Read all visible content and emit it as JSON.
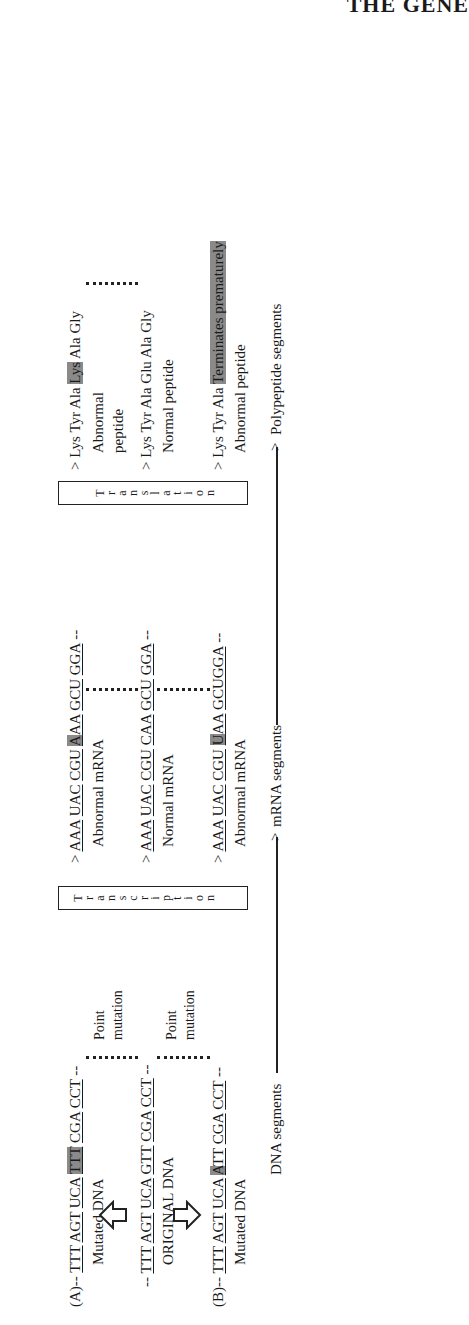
{
  "header": {
    "title": "THE GENE"
  },
  "rows": {
    "a": {
      "label": "(A)",
      "dna": [
        "TTT",
        "AGT",
        "UCA",
        "TTT",
        "CGA",
        "CCT"
      ],
      "dna_highlight_index": 3,
      "dna_caption": "Mutated DNA",
      "mrna": [
        "AAA",
        "UAC",
        "CGU",
        "AAA",
        "GCU",
        "GGA"
      ],
      "mrna_highlight_index": 3,
      "mrna_caption": "Abnormal mRNA",
      "peptide": [
        "Lys",
        "Tyr",
        "Ala",
        "Lys",
        "Ala",
        "Gly"
      ],
      "peptide_highlight_index": 3,
      "peptide_caption_1": "Abnormal",
      "peptide_caption_2": "peptide"
    },
    "original": {
      "dna": [
        "TTT",
        "AGT",
        "UCA",
        "GTT",
        "CGA",
        "CCT"
      ],
      "dna_caption": "ORIGINAL DNA",
      "mrna": [
        "AAA",
        "UAC",
        "CGU",
        "CAA",
        "GCU",
        "GGA"
      ],
      "mrna_caption": "Normal mRNA",
      "peptide": [
        "Lys",
        "Tyr",
        "Ala",
        "Glu",
        "Ala",
        "Gly"
      ],
      "peptide_caption": "Normal peptide"
    },
    "b": {
      "label": "(B)",
      "dna": [
        "TTT",
        "AGT",
        "UCA",
        "ATT",
        "CGA",
        "CCT"
      ],
      "dna_highlight_index": 3,
      "dna_caption": "Mutated DNA",
      "mrna": [
        "AAA",
        "UAC",
        "CGU",
        "UAA",
        "GCUGGA"
      ],
      "mrna_highlight": "U",
      "mrna_caption": "Abnormal mRNA",
      "peptide": [
        "Lys",
        "Tyr",
        "Ala"
      ],
      "peptide_terminator": "Terminates prematurely",
      "peptide_caption": "Abnormal peptide"
    }
  },
  "annotations": {
    "point_mutation_1": "Point",
    "point_mutation_2": "mutation"
  },
  "process_boxes": {
    "transcription": [
      "T",
      "r",
      "a",
      "n",
      "s",
      "c",
      "r",
      "i",
      "p",
      "t",
      "i",
      "o",
      "n"
    ],
    "translation": [
      "T",
      "r",
      "a",
      "n",
      "s",
      "l",
      "a",
      "t",
      "i",
      "o",
      "n"
    ]
  },
  "flow": {
    "dna_segments": "DNA segments",
    "mrna_segments": "mRNA segments",
    "polypeptide_segments": "Polypeptide segments"
  },
  "colors": {
    "highlight": "#8a8a8a",
    "ink": "#1a1a1a"
  }
}
